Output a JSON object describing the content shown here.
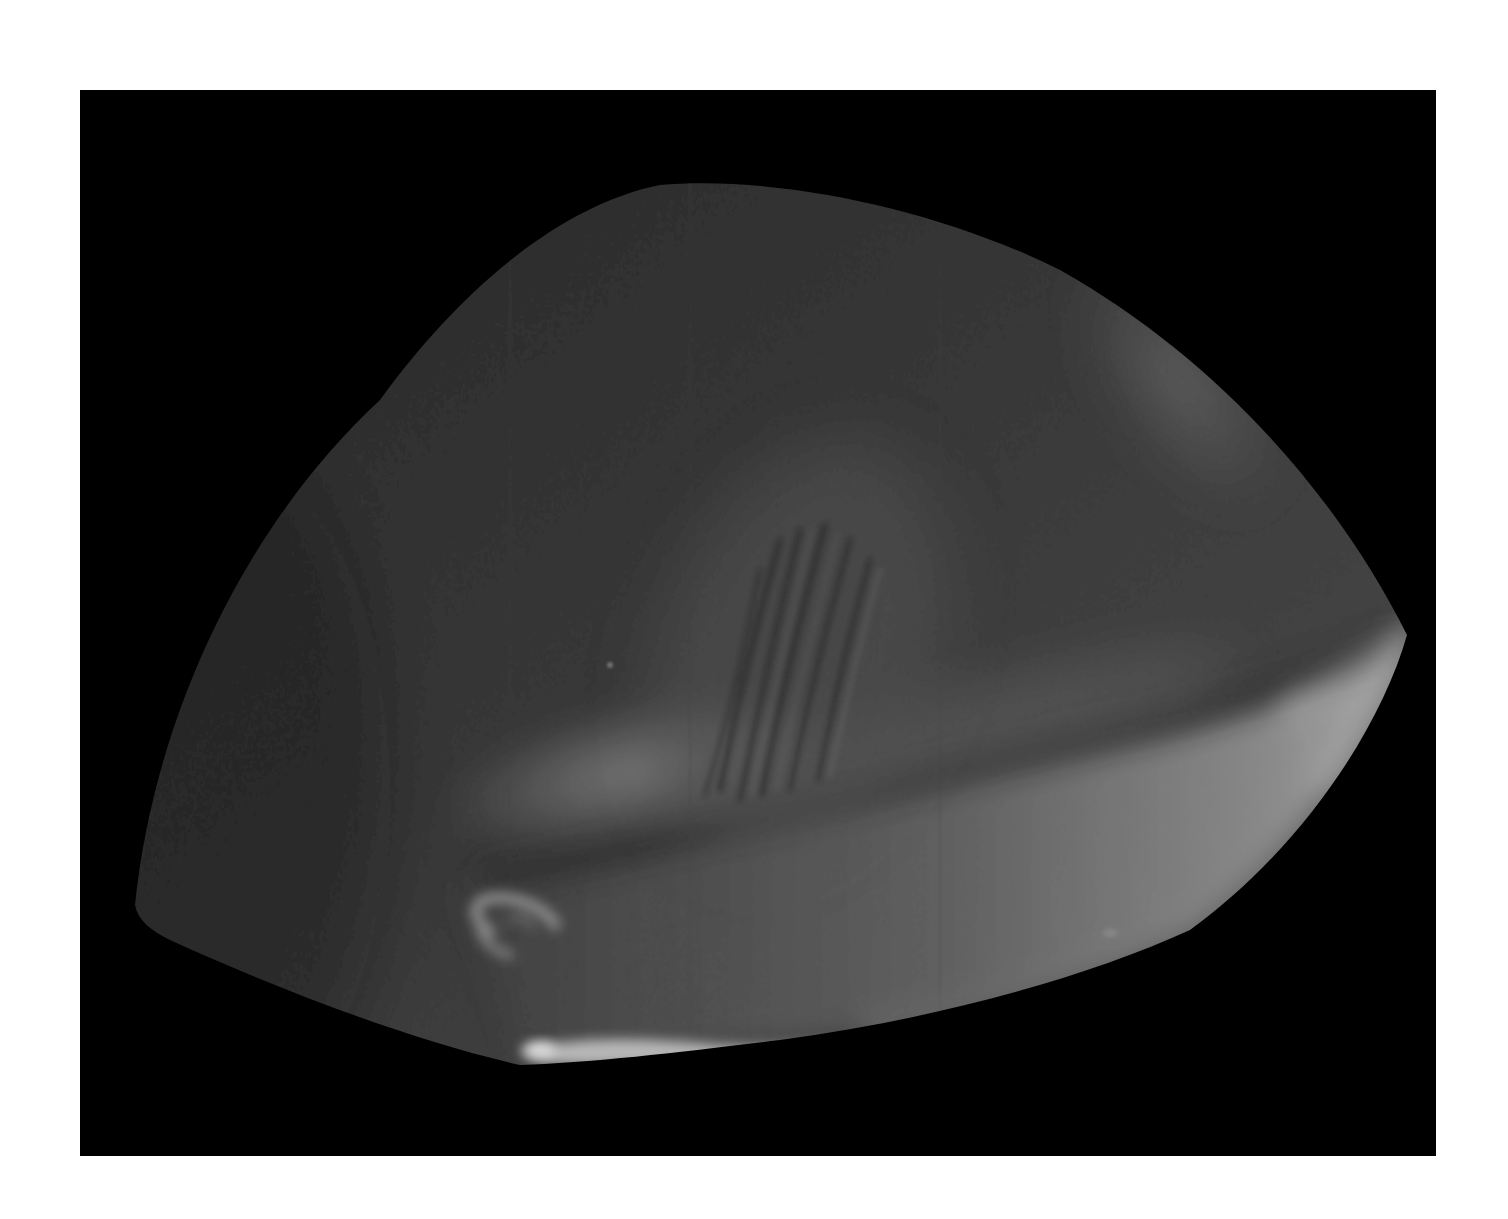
{
  "image": {
    "description": "Grayscale photograph of a translucent dome-shaped object on a black background",
    "background_color": "#ffffff",
    "frame_color": "#000000",
    "object": {
      "base_color": "#2e2e2e",
      "shadow_color": "#1a1a1a",
      "highlight_color": "#9a9a9a",
      "bright_rim_color": "#d8d8d8",
      "features": [
        "dome-body",
        "lower-lip-highlight",
        "central-striations",
        "diagonal-bright-band",
        "upper-right-sheen",
        "hook-shaped-highlight",
        "bottom-crescent-highlight"
      ]
    }
  }
}
